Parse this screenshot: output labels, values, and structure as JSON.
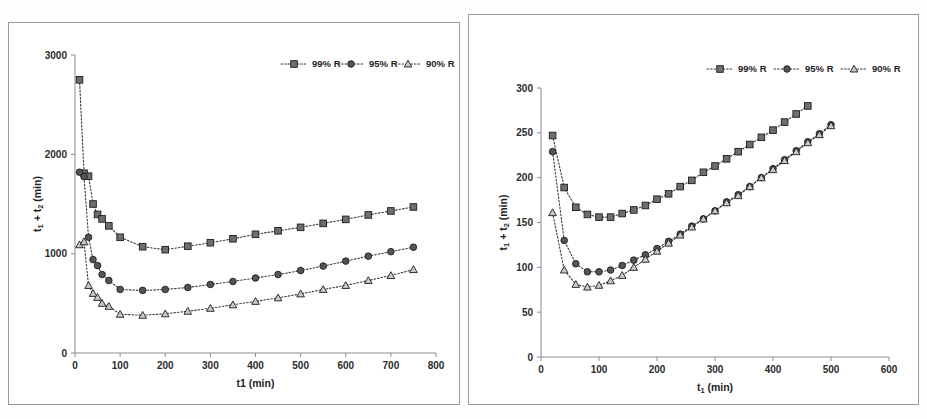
{
  "figure": {
    "background_color": "#ffffff",
    "ink_color": "#2b2b2b",
    "panel_border_color": "#9a9a9a"
  },
  "legend": {
    "position": "top-right",
    "entries": [
      {
        "label": "99% R",
        "marker": "square-marker",
        "line_style": "dotted"
      },
      {
        "label": "95% R",
        "marker": "circle-marker",
        "line_style": "dotted"
      },
      {
        "label": "90% R",
        "marker": "triangle-marker",
        "line_style": "dotted"
      }
    ]
  },
  "chart_data": [
    {
      "id": "left-chart",
      "type": "line",
      "title": "",
      "xlabel": "t1 (min)",
      "ylabel_parts": {
        "t": "t",
        "one": "1",
        "plus": " + ",
        "t2": "t",
        "two": "2",
        "unit": " (min)"
      },
      "ylabel": "t1 + t2 (min)",
      "xlim": [
        0,
        800
      ],
      "ylim": [
        0,
        3000
      ],
      "xticks": [
        0,
        100,
        200,
        300,
        400,
        500,
        600,
        700,
        800
      ],
      "yticks": [
        0,
        1000,
        2000,
        3000
      ],
      "grid": false,
      "legend_position": "top-right",
      "series": [
        {
          "name": "99% R",
          "marker": "square-marker",
          "x": [
            10,
            20,
            30,
            40,
            50,
            60,
            75,
            100,
            150,
            200,
            250,
            300,
            350,
            400,
            450,
            500,
            550,
            600,
            650,
            700,
            750
          ],
          "values": [
            2750,
            1810,
            1780,
            1500,
            1395,
            1350,
            1280,
            1165,
            1070,
            1040,
            1075,
            1110,
            1150,
            1195,
            1230,
            1265,
            1305,
            1345,
            1390,
            1430,
            1470
          ]
        },
        {
          "name": "95% R",
          "marker": "circle-marker",
          "x": [
            10,
            20,
            30,
            40,
            50,
            60,
            75,
            100,
            150,
            200,
            250,
            300,
            350,
            400,
            450,
            500,
            550,
            600,
            650,
            700,
            750
          ],
          "values": [
            1820,
            1775,
            1165,
            940,
            880,
            790,
            730,
            640,
            630,
            640,
            660,
            690,
            720,
            755,
            790,
            830,
            875,
            925,
            975,
            1020,
            1065
          ]
        },
        {
          "name": "90% R",
          "marker": "triangle-marker",
          "x": [
            10,
            20,
            30,
            40,
            50,
            60,
            75,
            100,
            150,
            200,
            250,
            300,
            350,
            400,
            450,
            500,
            550,
            600,
            650,
            700,
            750
          ],
          "values": [
            1090,
            1120,
            680,
            600,
            560,
            500,
            470,
            390,
            380,
            395,
            420,
            450,
            485,
            520,
            555,
            595,
            640,
            680,
            730,
            780,
            840
          ]
        }
      ]
    },
    {
      "id": "right-chart",
      "type": "line",
      "title": "",
      "xlabel": "t1 (min)",
      "ylabel_parts": {
        "t": "t",
        "one": "1",
        "plus": " + ",
        "t2": "t",
        "two": "2",
        "unit": " (min)"
      },
      "ylabel": "t1 + t2 (min)",
      "xlim": [
        0,
        600
      ],
      "ylim": [
        0,
        300
      ],
      "xticks": [
        0,
        100,
        200,
        300,
        400,
        500,
        600
      ],
      "yticks": [
        0,
        50,
        100,
        150,
        200,
        250,
        300
      ],
      "grid": false,
      "legend_position": "top-right",
      "series": [
        {
          "name": "99% R",
          "marker": "square-marker",
          "x": [
            20,
            40,
            60,
            80,
            100,
            120,
            140,
            160,
            180,
            200,
            220,
            240,
            260,
            280,
            300,
            320,
            340,
            360,
            380,
            400,
            420,
            440,
            460
          ],
          "values": [
            247,
            189,
            167,
            159,
            156,
            156,
            160,
            164,
            169,
            176,
            182,
            190,
            197,
            206,
            213,
            221,
            229,
            237,
            245,
            253,
            262,
            271,
            280
          ]
        },
        {
          "name": "95% R",
          "marker": "circle-marker",
          "x": [
            20,
            40,
            60,
            80,
            100,
            120,
            140,
            160,
            180,
            200,
            220,
            240,
            260,
            280,
            300,
            320,
            340,
            360,
            380,
            400,
            420,
            440,
            460,
            480,
            500
          ],
          "values": [
            229,
            130,
            104,
            95,
            95,
            97,
            102,
            108,
            114,
            121,
            129,
            137,
            146,
            154,
            163,
            173,
            181,
            190,
            200,
            210,
            220,
            230,
            240,
            249,
            259
          ]
        },
        {
          "name": "90% R",
          "marker": "triangle-marker",
          "x": [
            20,
            40,
            60,
            80,
            100,
            120,
            140,
            160,
            180,
            200,
            220,
            240,
            260,
            280,
            300,
            320,
            340,
            360,
            380,
            400,
            420,
            440,
            460,
            480,
            500
          ],
          "values": [
            161,
            97,
            81,
            78,
            80,
            85,
            91,
            100,
            109,
            118,
            127,
            136,
            145,
            154,
            163,
            172,
            180,
            190,
            200,
            209,
            219,
            229,
            239,
            248,
            258
          ]
        }
      ]
    }
  ]
}
